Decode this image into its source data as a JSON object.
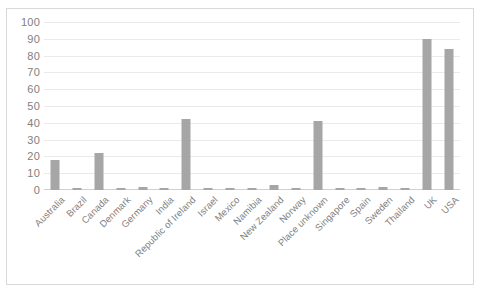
{
  "chart_data": {
    "type": "bar",
    "title": "",
    "xlabel": "",
    "ylabel": "",
    "ylim": [
      0,
      100
    ],
    "ytick_step": 10,
    "yticks": [
      0,
      10,
      20,
      30,
      40,
      50,
      60,
      70,
      80,
      90,
      100
    ],
    "grid": true,
    "legend": false,
    "bar_color": "#a6a6a6",
    "gridline_color": "#eaeaea",
    "axis_label_color": "#7f7f7f",
    "border_color": "#d9d9d9",
    "categories": [
      "Australia",
      "Brazil",
      "Canada",
      "Denmark",
      "Germany",
      "India",
      "Republic of Ireland",
      "Israel",
      "Mexico",
      "Namibia",
      "New Zealand",
      "Norway",
      "Place unknown",
      "Singapore",
      "Spain",
      "Sweden",
      "Thailand",
      "UK",
      "USA"
    ],
    "values": [
      18,
      1,
      22,
      1,
      2,
      1,
      42,
      1,
      1,
      1,
      3,
      1,
      41,
      1,
      1,
      2,
      1,
      90,
      84
    ]
  }
}
